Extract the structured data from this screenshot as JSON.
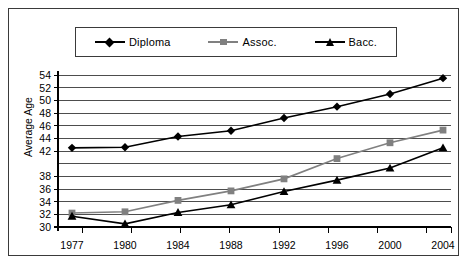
{
  "chart_data": {
    "type": "line",
    "title": "",
    "xlabel": "",
    "ylabel": "Average Age",
    "categories": [
      "1977",
      "1980",
      "1984",
      "1988",
      "1992",
      "1996",
      "2000",
      "2004"
    ],
    "ylim": [
      30,
      54
    ],
    "ytick_labels": [
      "54",
      "52",
      "50",
      "48",
      "46",
      "44",
      "42",
      "38",
      "36",
      "34",
      "32",
      "30"
    ],
    "ytick_values": [
      54,
      52,
      50,
      48,
      46,
      44,
      42,
      40,
      38,
      36,
      34,
      32,
      30
    ],
    "grid": true,
    "legend_position": "top",
    "series": [
      {
        "name": "Diploma",
        "marker": "diamond",
        "color": "#000000",
        "values": [
          42.5,
          42.6,
          44.3,
          45.2,
          47.2,
          49.0,
          51.0,
          53.5
        ]
      },
      {
        "name": "Assoc.",
        "marker": "square",
        "color": "#808080",
        "values": [
          32.2,
          32.4,
          34.2,
          35.7,
          37.6,
          40.8,
          43.3,
          45.3
        ]
      },
      {
        "name": "Bacc.",
        "marker": "triangle",
        "color": "#000000",
        "values": [
          31.7,
          30.5,
          32.3,
          33.5,
          35.6,
          37.4,
          39.3,
          42.5
        ]
      }
    ]
  },
  "legend": {
    "items": [
      {
        "label": "Diploma",
        "marker": "diamond-marker-icon",
        "color": "#000000"
      },
      {
        "label": "Assoc.",
        "marker": "square-marker-icon",
        "color": "#808080"
      },
      {
        "label": "Bacc.",
        "marker": "triangle-marker-icon",
        "color": "#000000"
      }
    ]
  },
  "colors": {
    "frame": "#3a3a3a",
    "axis": "#000000",
    "gridline": "#4d4d4d",
    "background": "#ffffff"
  }
}
